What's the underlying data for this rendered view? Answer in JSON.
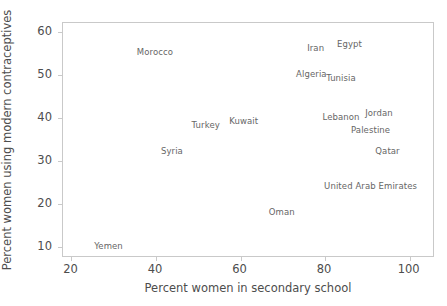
{
  "chart_data": {
    "type": "scatter",
    "title": "",
    "xlabel": "Percent women in secondary school",
    "ylabel": "Percent women using modern contraceptives",
    "xlim": [
      18,
      106
    ],
    "ylim": [
      7.5,
      62
    ],
    "xticks": [
      20,
      40,
      60,
      80,
      100
    ],
    "yticks": [
      10,
      20,
      30,
      40,
      50,
      60
    ],
    "grid": false,
    "legend": null,
    "point_style": "text-label-only",
    "labels": [
      "Yemen",
      "Syria",
      "Morocco",
      "Turkey",
      "Kuwait",
      "Oman",
      "Algeria",
      "Iran",
      "Lebanon",
      "Tunisia",
      "Egypt",
      "Palestine",
      "United Arab Emirates",
      "Jordan",
      "Qatar"
    ],
    "x": [
      29,
      44,
      40,
      52,
      61,
      70,
      77,
      78,
      84,
      84,
      86,
      91,
      91,
      93,
      95
    ],
    "y": [
      10,
      32,
      55,
      38,
      39,
      18,
      50,
      56,
      40,
      49,
      57,
      37,
      24,
      41,
      32
    ],
    "points": [
      {
        "label": "Yemen",
        "x": 29,
        "y": 10
      },
      {
        "label": "Syria",
        "x": 44,
        "y": 32
      },
      {
        "label": "Morocco",
        "x": 40,
        "y": 55
      },
      {
        "label": "Turkey",
        "x": 52,
        "y": 38
      },
      {
        "label": "Kuwait",
        "x": 61,
        "y": 39
      },
      {
        "label": "Oman",
        "x": 70,
        "y": 18
      },
      {
        "label": "Algeria",
        "x": 77,
        "y": 50
      },
      {
        "label": "Iran",
        "x": 78,
        "y": 56
      },
      {
        "label": "Lebanon",
        "x": 84,
        "y": 40
      },
      {
        "label": "Tunisia",
        "x": 84,
        "y": 49
      },
      {
        "label": "Egypt",
        "x": 86,
        "y": 57
      },
      {
        "label": "Palestine",
        "x": 91,
        "y": 37
      },
      {
        "label": "United Arab Emirates",
        "x": 91,
        "y": 24
      },
      {
        "label": "Jordan",
        "x": 93,
        "y": 41
      },
      {
        "label": "Qatar",
        "x": 95,
        "y": 32
      }
    ]
  },
  "colors": {
    "text": "#4d4d4d",
    "point_label": "#666666",
    "frame": "#c9c9c9",
    "background": "#ffffff"
  }
}
